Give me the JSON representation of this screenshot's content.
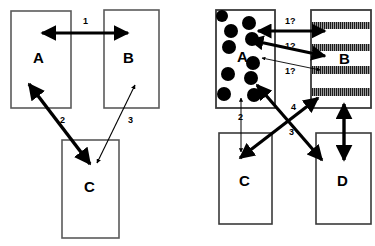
{
  "figure": {
    "panels": [
      {
        "id": "left",
        "name": "left-panel",
        "boxes": [
          {
            "id": "A",
            "label": "A",
            "fill": "plain",
            "x": 11,
            "y": 11,
            "w": 60,
            "h": 97,
            "label_x": 38,
            "label_y": 57
          },
          {
            "id": "B",
            "label": "B",
            "fill": "plain",
            "x": 104,
            "y": 10,
            "w": 55,
            "h": 98,
            "label_x": 128,
            "label_y": 57
          },
          {
            "id": "C",
            "label": "C",
            "fill": "plain",
            "x": 62,
            "y": 140,
            "w": 57,
            "h": 98,
            "label_x": 88,
            "label_y": 186
          }
        ],
        "edges": [
          {
            "id": "1",
            "label": "1",
            "style": "thick",
            "heads": "both",
            "label_x": 83,
            "label_y": 17
          },
          {
            "id": "2",
            "label": "2",
            "style": "thick",
            "heads": "both",
            "label_x": 60,
            "label_y": 116
          },
          {
            "id": "3",
            "label": "3",
            "style": "thin",
            "heads": "both",
            "label_x": 128,
            "label_y": 116
          }
        ]
      },
      {
        "id": "right",
        "name": "right-panel",
        "boxes": [
          {
            "id": "A",
            "label": "A",
            "fill": "dots",
            "x": 216,
            "y": 10,
            "w": 59,
            "h": 98,
            "label_x": 241,
            "label_y": 56
          },
          {
            "id": "B",
            "label": "B",
            "fill": "bands",
            "x": 311,
            "y": 10,
            "w": 60,
            "h": 98,
            "label_x": 343,
            "label_y": 58
          },
          {
            "id": "C",
            "label": "C",
            "fill": "plain",
            "x": 219,
            "y": 133,
            "w": 53,
            "h": 91,
            "label_x": 243,
            "label_y": 180
          },
          {
            "id": "D",
            "label": "D",
            "fill": "plain",
            "x": 316,
            "y": 133,
            "w": 55,
            "h": 91,
            "label_x": 341,
            "label_y": 180
          }
        ],
        "edges": [
          {
            "id": "q1a",
            "label": "1?",
            "style": "thick",
            "heads": "both",
            "label_x": 289,
            "label_y": 19
          },
          {
            "id": "q1b",
            "label": "1?",
            "style": "thick",
            "heads": "both",
            "label_x": 289,
            "label_y": 44
          },
          {
            "id": "q1c",
            "label": "1?",
            "style": "thin",
            "heads": "both",
            "label_x": 289,
            "label_y": 69
          },
          {
            "id": "2",
            "label": "2",
            "style": "thin",
            "heads": "both",
            "label_x": 241,
            "label_y": 114
          },
          {
            "id": "3",
            "label": "3",
            "style": "thick",
            "heads": "both",
            "label_x": 292,
            "label_y": 128
          },
          {
            "id": "4",
            "label": "4",
            "style": "thick",
            "heads": "both",
            "label_x": 292,
            "label_y": 104
          },
          {
            "id": "bd",
            "label": "",
            "style": "thick",
            "heads": "both",
            "label_x": 0,
            "label_y": 0
          }
        ]
      }
    ],
    "colors": {
      "stroke": "#000000",
      "box_outline": "#5a5a5a",
      "band_fill": "#8a8a8a",
      "dot_fill": "#000000",
      "background": "#ffffff"
    },
    "dots": [
      {
        "cx": 222,
        "cy": 16,
        "r": 6
      },
      {
        "cx": 249,
        "cy": 23,
        "r": 7
      },
      {
        "cx": 231,
        "cy": 31,
        "r": 7
      },
      {
        "cx": 252,
        "cy": 39,
        "r": 7
      },
      {
        "cx": 229,
        "cy": 47,
        "r": 7
      },
      {
        "cx": 253,
        "cy": 63,
        "r": 7
      },
      {
        "cx": 228,
        "cy": 74,
        "r": 7
      },
      {
        "cx": 251,
        "cy": 78,
        "r": 7
      },
      {
        "cx": 224,
        "cy": 94,
        "r": 7
      },
      {
        "cx": 254,
        "cy": 95,
        "r": 7
      }
    ],
    "bands": [
      {
        "x": 313,
        "y": 22,
        "w": 56,
        "h": 7
      },
      {
        "x": 313,
        "y": 44,
        "w": 56,
        "h": 7
      },
      {
        "x": 313,
        "y": 66,
        "w": 56,
        "h": 8
      },
      {
        "x": 313,
        "y": 88,
        "w": 56,
        "h": 8
      }
    ]
  }
}
